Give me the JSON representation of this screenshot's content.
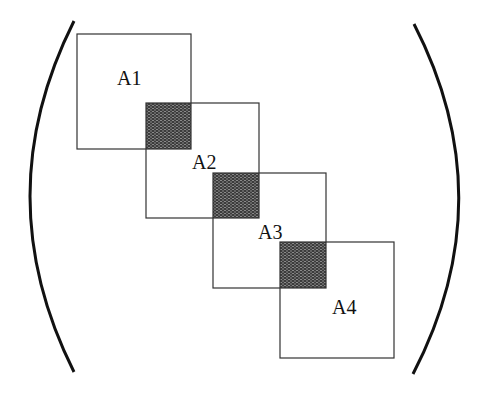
{
  "diagram": {
    "type": "block-diagonal matrix with overlapping blocks",
    "blocks": [
      {
        "label": "A1",
        "x": 77,
        "y": 34,
        "w": 114,
        "h": 115,
        "label_x": 117,
        "label_y": 85
      },
      {
        "label": "A2",
        "x": 146,
        "y": 103,
        "w": 113,
        "h": 115,
        "label_x": 192,
        "label_y": 169
      },
      {
        "label": "A3",
        "x": 213,
        "y": 173,
        "w": 113,
        "h": 115,
        "label_x": 258,
        "label_y": 239
      },
      {
        "label": "A4",
        "x": 280,
        "y": 242,
        "w": 114,
        "h": 116,
        "label_x": 332,
        "label_y": 314
      }
    ],
    "overlaps": [
      {
        "x": 146,
        "y": 103,
        "w": 45,
        "h": 46
      },
      {
        "x": 213,
        "y": 173,
        "w": 46,
        "h": 45
      },
      {
        "x": 280,
        "y": 242,
        "w": 46,
        "h": 46
      }
    ],
    "colors": {
      "block_stroke": "#333333",
      "overlap_fill": "#4a4a4a",
      "bracket_stroke": "#111111",
      "background": "#ffffff"
    }
  }
}
